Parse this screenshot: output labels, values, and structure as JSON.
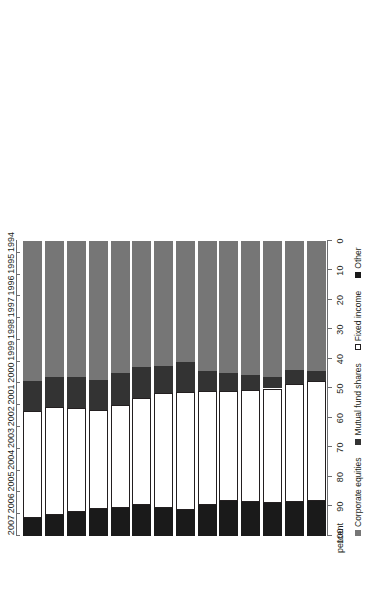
{
  "chart_data": {
    "type": "bar",
    "orientation": "horizontal-stacked",
    "title": "",
    "subtitle": "",
    "xlabel": "percent",
    "ylabel": "",
    "xlim": [
      100,
      0
    ],
    "axis_reversed": true,
    "grid": false,
    "legend_position": "bottom",
    "tick_labels": [
      "100",
      "90",
      "80",
      "70",
      "60",
      "50",
      "40",
      "30",
      "20",
      "10",
      "0"
    ],
    "tick_values": [
      100,
      90,
      80,
      70,
      60,
      50,
      40,
      30,
      20,
      10,
      0
    ],
    "categories": [
      "1994",
      "1995",
      "1996",
      "1997",
      "1998",
      "1999",
      "2000",
      "2001",
      "2002",
      "2003",
      "2004",
      "2005",
      "2006",
      "2007"
    ],
    "series": [
      {
        "name": "Other",
        "color": "#1a1a1a",
        "values": [
          11.8,
          11.5,
          11.2,
          11.4,
          12.0,
          10.6,
          8.8,
          9.6,
          10.6,
          9.5,
          9.2,
          8.3,
          7.2,
          6.1
        ]
      },
      {
        "name": "Fixed income",
        "color": "#ffffff",
        "values": [
          40.7,
          40.0,
          38.8,
          38.2,
          37.0,
          38.4,
          40.0,
          39.0,
          36.1,
          34.9,
          33.6,
          35.1,
          36.6,
          36.3
        ]
      },
      {
        "name": "Mutual fund shares",
        "color": "#333333",
        "values": [
          3.4,
          4.7,
          3.9,
          4.9,
          6.3,
          6.9,
          10.3,
          9.1,
          10.6,
          10.8,
          10.2,
          10.4,
          10.0,
          10.2
        ]
      },
      {
        "name": "Corporate equities",
        "color": "#767676",
        "values": [
          44.1,
          43.8,
          46.1,
          45.5,
          44.7,
          44.1,
          40.9,
          42.3,
          42.7,
          44.8,
          47.0,
          46.2,
          46.2,
          47.4
        ]
      }
    ],
    "legend": [
      {
        "label": "Corporate equities",
        "color": "#767676",
        "marker": "filled-square"
      },
      {
        "label": "Mutual fund shares",
        "color": "#333333",
        "marker": "filled-square"
      },
      {
        "label": "Fixed income",
        "color": "#ffffff",
        "marker": "open-square"
      },
      {
        "label": "Other",
        "color": "#1a1a1a",
        "marker": "filled-square"
      }
    ]
  }
}
